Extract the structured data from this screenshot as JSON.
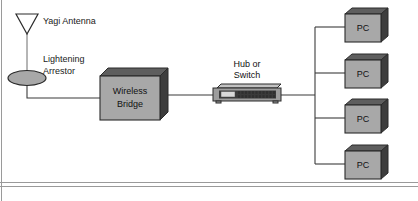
{
  "diagram": {
    "background_color": "#ffffff",
    "line_color": "#3b3b3b",
    "node_fill_color": "#a8a8a8",
    "node_shadow_color": "#3d3d3d",
    "labels": {
      "yagi_antenna": "Yagi Antenna",
      "lightening_arrestor_line1": "Lightening",
      "lightening_arrestor_line2": "Arrestor",
      "wireless_bridge_line1": "Wireless",
      "wireless_bridge_line2": "Bridge",
      "hub_or_switch_line1": "Hub or",
      "hub_or_switch_line2": "Switch"
    },
    "pcs": [
      {
        "label": "PC"
      },
      {
        "label": "PC"
      },
      {
        "label": "PC"
      },
      {
        "label": "PC"
      }
    ]
  }
}
